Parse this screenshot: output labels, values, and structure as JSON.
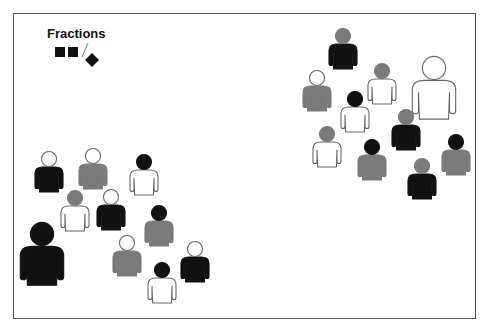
{
  "legend": {
    "title": "Fractions",
    "icons": [
      "square",
      "square",
      "slash",
      "diamond"
    ]
  },
  "colors": {
    "black": "#111111",
    "gray": "#7a7a7a",
    "white": "#ffffff",
    "outline": "#666666"
  },
  "figures": [
    {
      "group": "right",
      "head": "gray",
      "body": "black",
      "size": "small"
    },
    {
      "group": "right",
      "head": "white",
      "body": "gray",
      "size": "small"
    },
    {
      "group": "right",
      "head": "gray",
      "body": "white",
      "size": "small"
    },
    {
      "group": "right",
      "head": "white",
      "body": "white",
      "size": "large"
    },
    {
      "group": "right",
      "head": "black",
      "body": "white",
      "size": "small"
    },
    {
      "group": "right",
      "head": "gray",
      "body": "black",
      "size": "small"
    },
    {
      "group": "right",
      "head": "gray",
      "body": "white",
      "size": "small"
    },
    {
      "group": "right",
      "head": "black",
      "body": "gray",
      "size": "small"
    },
    {
      "group": "right",
      "head": "black",
      "body": "gray",
      "size": "small"
    },
    {
      "group": "right",
      "head": "gray",
      "body": "black",
      "size": "small"
    },
    {
      "group": "left",
      "head": "white",
      "body": "black",
      "size": "small"
    },
    {
      "group": "left",
      "head": "white",
      "body": "gray",
      "size": "small"
    },
    {
      "group": "left",
      "head": "black",
      "body": "white",
      "size": "small"
    },
    {
      "group": "left",
      "head": "gray",
      "body": "white",
      "size": "small"
    },
    {
      "group": "left",
      "head": "white",
      "body": "black",
      "size": "small"
    },
    {
      "group": "left",
      "head": "black",
      "body": "gray",
      "size": "small"
    },
    {
      "group": "left",
      "head": "black",
      "body": "black",
      "size": "large"
    },
    {
      "group": "left",
      "head": "white",
      "body": "gray",
      "size": "small"
    },
    {
      "group": "left",
      "head": "white",
      "body": "black",
      "size": "small"
    },
    {
      "group": "left",
      "head": "black",
      "body": "white",
      "size": "small"
    }
  ]
}
